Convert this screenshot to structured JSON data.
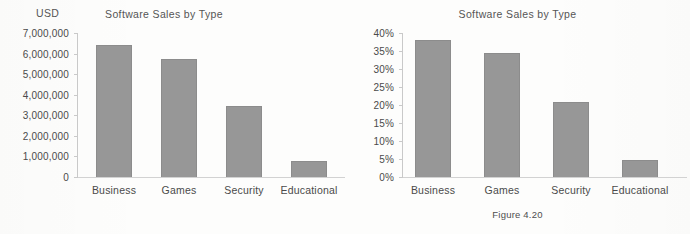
{
  "figure": {
    "caption": "Figure 4.20"
  },
  "chart_data": [
    {
      "id": "left",
      "type": "bar",
      "title": "Software Sales by Type",
      "ylabel": "USD",
      "xlabel": "",
      "categories": [
        "Business",
        "Games",
        "Security",
        "Educational"
      ],
      "values": [
        6400000,
        5750000,
        3450000,
        770000
      ],
      "ylim": [
        0,
        7000000
      ],
      "ytick_values": [
        0,
        1000000,
        2000000,
        3000000,
        4000000,
        5000000,
        6000000,
        7000000
      ],
      "ytick_labels": [
        "0",
        "1,000,000",
        "2,000,000",
        "3,000,000",
        "4,000,000",
        "5,000,000",
        "6,000,000",
        "7,000,000"
      ],
      "grid": false,
      "legend": "none",
      "bar_color": "#979797",
      "bar_border_color": "#8c8c8c",
      "axis_color": "#c9c9c9"
    },
    {
      "id": "right",
      "type": "bar",
      "title": "Software Sales by Type",
      "ylabel": "",
      "xlabel": "",
      "categories": [
        "Business",
        "Games",
        "Security",
        "Educational"
      ],
      "values": [
        38.0,
        34.5,
        20.8,
        4.6
      ],
      "ylim": [
        0,
        40
      ],
      "ytick_values": [
        0,
        5,
        10,
        15,
        20,
        25,
        30,
        35,
        40
      ],
      "ytick_labels": [
        "0%",
        "5%",
        "10%",
        "15%",
        "20%",
        "25%",
        "30%",
        "35%",
        "40%"
      ],
      "grid": false,
      "legend": "none",
      "bar_color": "#979797",
      "bar_border_color": "#8c8c8c",
      "axis_color": "#c9c9c9"
    }
  ]
}
